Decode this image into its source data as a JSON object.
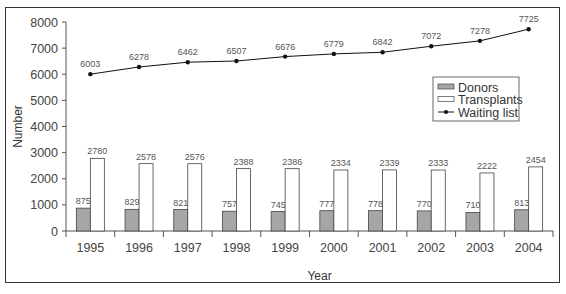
{
  "chart_data": {
    "type": "bar",
    "title": "",
    "xlabel": "Year",
    "ylabel": "Number",
    "ylim": [
      0,
      8000
    ],
    "yticks": [
      0,
      1000,
      2000,
      3000,
      4000,
      5000,
      6000,
      7000,
      8000
    ],
    "categories": [
      "1995",
      "1996",
      "1997",
      "1998",
      "1999",
      "2000",
      "2001",
      "2002",
      "2003",
      "2004"
    ],
    "series": [
      {
        "name": "Donors",
        "kind": "bar",
        "color": "#a6a6a6",
        "values": [
          875,
          829,
          821,
          757,
          745,
          777,
          778,
          770,
          710,
          813
        ]
      },
      {
        "name": "Transplants",
        "kind": "bar",
        "color": "#ffffff",
        "values": [
          2780,
          2578,
          2576,
          2388,
          2386,
          2334,
          2339,
          2333,
          2222,
          2454
        ]
      },
      {
        "name": "Waiting list",
        "kind": "line",
        "color": "#111111",
        "values": [
          6003,
          6278,
          6462,
          6507,
          6676,
          6779,
          6842,
          7072,
          7278,
          7725
        ]
      }
    ],
    "legend": {
      "position": "right-middle",
      "entries": [
        "Donors",
        "Transplants",
        "Waiting list"
      ]
    },
    "grid": false,
    "data_labels": true
  }
}
